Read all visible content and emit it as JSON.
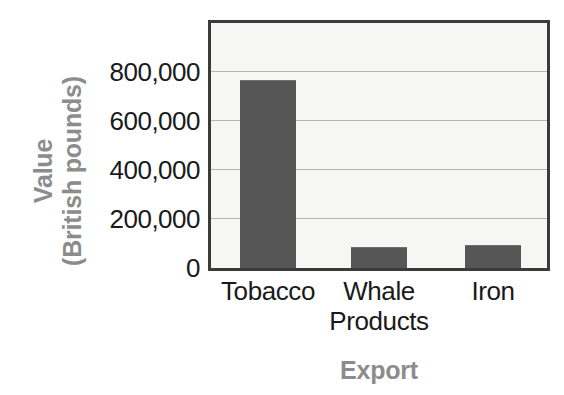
{
  "chart_data": {
    "type": "bar",
    "title": "",
    "xlabel": "Export",
    "ylabel": "Value\n(British pounds)",
    "ylabel_lines": [
      "Value",
      "(British pounds)"
    ],
    "categories": [
      "Tobacco",
      "Whale Products",
      "Iron"
    ],
    "category_lines": [
      [
        "Tobacco"
      ],
      [
        "Whale",
        "Products"
      ],
      [
        "Iron"
      ]
    ],
    "values": [
      766000,
      87000,
      95000
    ],
    "ylim": [
      0,
      1000000
    ],
    "yticks": [
      0,
      200000,
      400000,
      600000,
      800000
    ],
    "ytick_labels": [
      "0",
      "200,000",
      "400,000",
      "600,000",
      "800,000"
    ],
    "grid": true,
    "grid_axis": "y",
    "legend": false,
    "legend_position": "none",
    "bar_color": "#565656",
    "plot_background": "#f6f6f4",
    "frame_color": "#3b3b3b",
    "gridline_color": "#b6b6b6",
    "axis_title_color": "#8c8c8c",
    "tick_label_color": "#1a1a1a"
  }
}
